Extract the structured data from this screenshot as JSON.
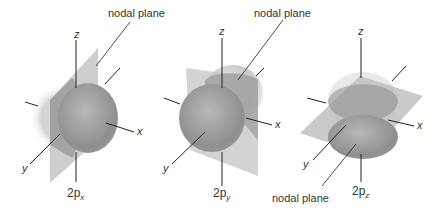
{
  "figure": {
    "panels": [
      {
        "id": "2px",
        "orbital": "2p",
        "subscript": "x",
        "nodal_label": "nodal plane",
        "axes": {
          "x": "x",
          "y": "y",
          "z": "z"
        }
      },
      {
        "id": "2py",
        "orbital": "2p",
        "subscript": "y",
        "nodal_label": "nodal plane",
        "axes": {
          "x": "x",
          "y": "y",
          "z": "z"
        }
      },
      {
        "id": "2pz",
        "orbital": "2p",
        "subscript": "z",
        "nodal_label": "nodal plane",
        "axes": {
          "x": "x",
          "y": "y",
          "z": "z"
        }
      }
    ]
  }
}
